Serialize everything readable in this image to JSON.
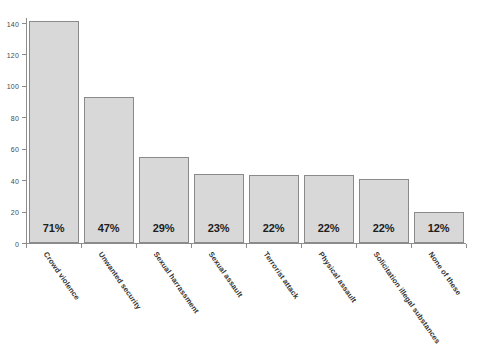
{
  "chart_data": {
    "type": "bar",
    "title": "",
    "subtitle": "",
    "xlabel": "",
    "ylabel": "",
    "ylim": [
      0,
      140
    ],
    "y_ticks": [
      0,
      20,
      40,
      60,
      80,
      100,
      120,
      140
    ],
    "grid": false,
    "legend": "none",
    "categories": [
      "Crowd violence",
      "Unwanted security",
      "Sexual harrassment",
      "Sexual assault",
      "Terrorist attack",
      "Physical assault",
      "Solicitation illegal substances",
      "None of these"
    ],
    "values": [
      141,
      93,
      55,
      44,
      43,
      43,
      41,
      20
    ],
    "data_labels": [
      "71%",
      "47%",
      "29%",
      "23%",
      "22%",
      "22%",
      "22%",
      "12%"
    ],
    "series": [
      {
        "name": "Count",
        "values": [
          141,
          93,
          55,
          44,
          43,
          43,
          41,
          20
        ]
      }
    ],
    "colors": {
      "bar_fill": "#d8d8d8",
      "bar_border": "#8a8a8a",
      "axis": "#8c8c8c",
      "tick_label": "#4a4a4a",
      "category_label": "#333333",
      "data_label": "#1d1d1d",
      "background": "#ffffff"
    }
  }
}
